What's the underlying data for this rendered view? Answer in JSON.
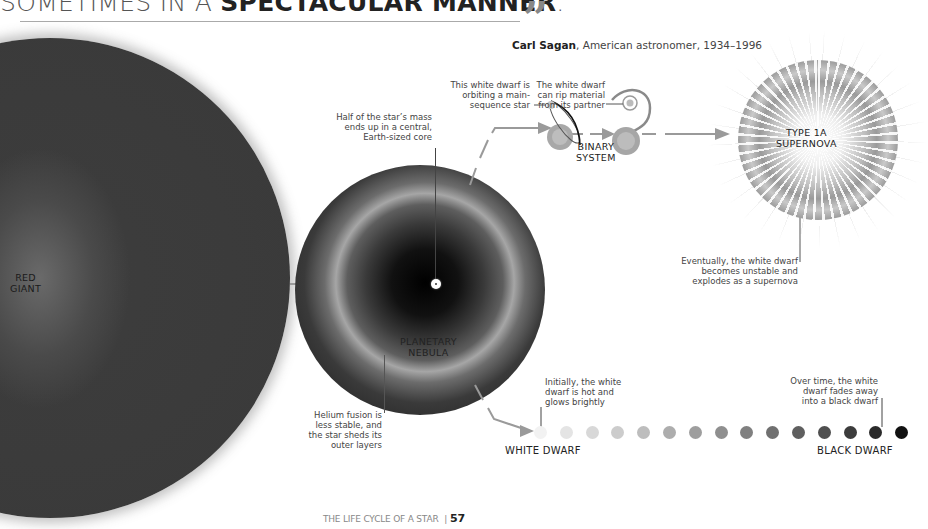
{
  "header": {
    "headline_light": "SOMETIMES IN A ",
    "headline_bold": "SPECTACULAR MANNER",
    "headline_end": ".",
    "quote_mark": "”",
    "attribution_name": "Carl Sagan",
    "attribution_rest": ", American astronomer, 1934–1996"
  },
  "stages": {
    "red_giant": {
      "line1": "RED",
      "line2": "GIANT"
    },
    "planetary_nebula": {
      "line1": "PLANETARY",
      "line2": "NEBULA"
    },
    "binary_system": {
      "line1": "BINARY",
      "line2": "SYSTEM"
    },
    "supernova": {
      "line1": "TYPE 1A",
      "line2": "SUPERNOVA"
    },
    "white_dwarf": "WHITE DWARF",
    "black_dwarf": "BLACK DWARF"
  },
  "annotations": {
    "core": [
      "Half of the star’s mass",
      "ends up in a central,",
      "Earth-sized core"
    ],
    "helium": [
      "Helium fusion is",
      "less stable, and",
      "the star sheds its",
      "outer layers"
    ],
    "orbiting": [
      "This white dwarf is",
      "orbiting a main-",
      "sequence star"
    ],
    "rip": [
      "The white dwarf",
      "can rip material",
      "from its partner"
    ],
    "explodes": [
      "Eventually, the white dwarf",
      "becomes unstable and",
      "explodes as a supernova"
    ],
    "initially": [
      "Initially, the white",
      "dwarf is hot and",
      "glows brightly"
    ],
    "over_time": [
      "Over time, the white",
      "dwarf fades away",
      "into a black dwarf"
    ]
  },
  "cooling_sequence": {
    "count": 15,
    "colors": [
      "#f2f2f2",
      "#e4e4e4",
      "#d8d8d8",
      "#cccccc",
      "#bdbdbd",
      "#adadad",
      "#9e9e9e",
      "#8f8f8f",
      "#808080",
      "#707070",
      "#5f5f5f",
      "#4f4f4f",
      "#3c3c3c",
      "#2a2a2a",
      "#111111"
    ]
  },
  "footer": {
    "section": "THE LIFE CYCLE OF A STAR",
    "separator": "|",
    "page_number": "57"
  }
}
